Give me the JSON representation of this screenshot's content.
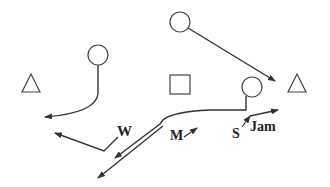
{
  "diagram": {
    "type": "football-play-diagram",
    "colors": {
      "stroke": "#333333",
      "label": "#222222",
      "background": "#ffffff"
    },
    "players": [
      {
        "id": "left-triangle",
        "shape": "triangle",
        "x": 31,
        "y": 83
      },
      {
        "id": "right-triangle",
        "shape": "triangle",
        "x": 297,
        "y": 83
      },
      {
        "id": "center-square",
        "shape": "square",
        "x": 180,
        "y": 85
      },
      {
        "id": "circle-left",
        "shape": "circle",
        "x": 98,
        "y": 55
      },
      {
        "id": "circle-top",
        "shape": "circle",
        "x": 180,
        "y": 22
      },
      {
        "id": "circle-right",
        "shape": "circle",
        "x": 252,
        "y": 87
      }
    ],
    "labels": {
      "w": "W",
      "m": "M",
      "s": "S",
      "jam": "Jam"
    }
  }
}
